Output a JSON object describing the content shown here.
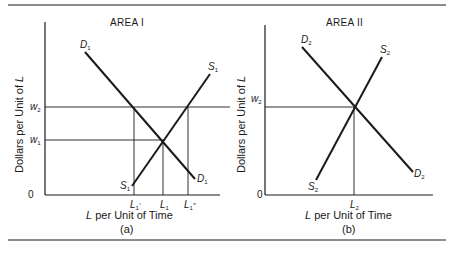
{
  "panels": [
    {
      "id": "a",
      "title": "AREA I",
      "caption": "(a)",
      "ylabel_prefix": "Dollars per Unit of ",
      "ylabel_var": "L",
      "xlabel_var": "L",
      "xlabel_suffix": " per Unit of Time",
      "origin": "0",
      "wage_labels": [
        {
          "base": "w",
          "sub": "2"
        },
        {
          "base": "w",
          "sub": "1"
        }
      ],
      "quantity_labels": [
        {
          "base": "L",
          "sub": "1",
          "mark": "′"
        },
        {
          "base": "L",
          "sub": "1",
          "mark": ""
        },
        {
          "base": "L",
          "sub": "1",
          "mark": "″"
        }
      ],
      "demand_label": {
        "base": "D",
        "sub": "1"
      },
      "supply_label": {
        "base": "S",
        "sub": "1"
      }
    },
    {
      "id": "b",
      "title": "AREA II",
      "caption": "(b)",
      "ylabel_prefix": "Dollars per Unit of ",
      "ylabel_var": "L",
      "xlabel_var": "L",
      "xlabel_suffix": " per Unit of Time",
      "origin": "0",
      "wage_labels": [
        {
          "base": "w",
          "sub": "2"
        }
      ],
      "quantity_labels": [
        {
          "base": "L",
          "sub": "2",
          "mark": ""
        }
      ],
      "demand_label": {
        "base": "D",
        "sub": "2"
      },
      "supply_label": {
        "base": "S",
        "sub": "2"
      }
    }
  ],
  "colors": {
    "ink": "#1a1a1a",
    "background": "#ffffff"
  }
}
